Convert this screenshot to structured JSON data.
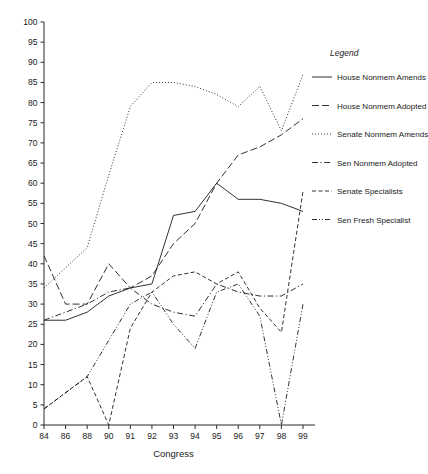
{
  "chart_data": {
    "type": "line",
    "title": "",
    "xlabel": "Congress",
    "ylabel": "",
    "x": [
      "84",
      "86",
      "88",
      "90",
      "91",
      "92",
      "93",
      "94",
      "95",
      "96",
      "97",
      "98",
      "99"
    ],
    "xlim": [
      0,
      12
    ],
    "ylim": [
      0,
      100
    ],
    "ytick_labels": [
      "0",
      "5",
      "10",
      "15",
      "20",
      "25",
      "30",
      "35",
      "40",
      "45",
      "50",
      "55",
      "60",
      "65",
      "70",
      "75",
      "80",
      "85",
      "90",
      "95",
      "100"
    ],
    "ytick_values": [
      0,
      5,
      10,
      15,
      20,
      25,
      30,
      35,
      40,
      45,
      50,
      55,
      60,
      65,
      70,
      75,
      80,
      85,
      90,
      95,
      100
    ],
    "grid": false,
    "legend_position": "right-outside",
    "legend_title": "Legend",
    "series": [
      {
        "name": "House Nonmem Amends",
        "dash": "solid",
        "values": [
          26,
          26,
          28,
          32,
          34,
          35,
          52,
          53,
          60,
          56,
          56,
          55,
          53
        ]
      },
      {
        "name": "House Nonmem Adopted",
        "dash": "dashed-long",
        "values": [
          42,
          30,
          30,
          40,
          34,
          37,
          45,
          50,
          60,
          67,
          69,
          72,
          76
        ]
      },
      {
        "name": "Senate Nonmem Amends",
        "dash": "dotted",
        "values": [
          34,
          39,
          44,
          62,
          79,
          85,
          85,
          84,
          82,
          79,
          84,
          73,
          87
        ]
      },
      {
        "name": "Sen Nonmem Adopted",
        "dash": "dash-dot",
        "values": [
          26,
          28,
          30,
          33,
          34,
          30,
          28,
          27,
          35,
          33,
          32,
          32,
          35
        ]
      },
      {
        "name": "Senate Specialists",
        "dash": "dashed-short",
        "values": [
          4,
          8,
          12,
          0,
          24,
          33,
          37,
          38,
          35,
          38,
          29,
          23,
          58
        ]
      },
      {
        "name": "Sen Fresh Specialist",
        "dash": "dash-dot-dot",
        "values": [
          4,
          8,
          12,
          21,
          30,
          33,
          25,
          19,
          33,
          35,
          27,
          0,
          30
        ]
      }
    ]
  },
  "legend": {
    "title": "Legend",
    "items": [
      {
        "label": "House Nonmem Amends",
        "dash": "solid"
      },
      {
        "label": "House Nonmem Adopted",
        "dash": "dashed-long"
      },
      {
        "label": "Senate Nonmem Amends",
        "dash": "dotted"
      },
      {
        "label": "Sen Nonmem Adopted",
        "dash": "dash-dot"
      },
      {
        "label": "Senate Specialists",
        "dash": "dashed-short"
      },
      {
        "label": "Sen Fresh Specialist",
        "dash": "dash-dot-dot"
      }
    ]
  },
  "colors": {
    "ink": "#1a1a1a",
    "axis": "#2b2b2b",
    "background": "#ffffff"
  }
}
